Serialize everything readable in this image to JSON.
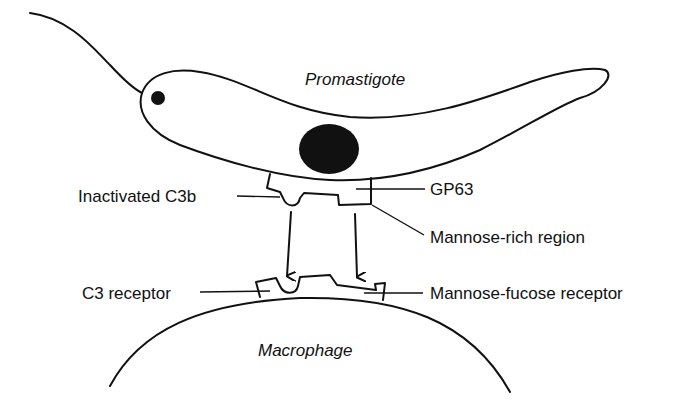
{
  "diagram": {
    "cells": {
      "promastigote": "Promastigote",
      "macrophage": "Macrophage"
    },
    "labels": {
      "inactivated_c3b": "Inactivated C3b",
      "gp63": "GP63",
      "mannose_rich_region": "Mannose-rich region",
      "c3_receptor": "C3 receptor",
      "mannose_fucose_receptor": "Mannose-fucose receptor"
    },
    "colors": {
      "ink": "#111111",
      "background": "#ffffff"
    }
  }
}
